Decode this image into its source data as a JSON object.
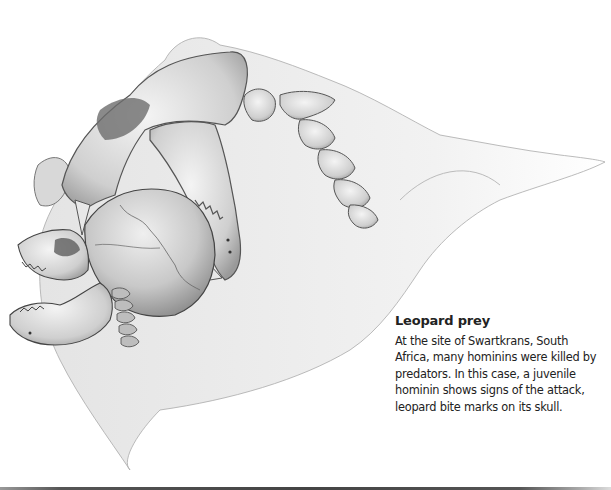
{
  "figure": {
    "illustration_subject": "leopard-skull-biting-hominin-skull",
    "colors": {
      "text": "#222222",
      "background": "#ffffff",
      "rule": "#444444"
    }
  },
  "caption": {
    "title": "Leopard prey",
    "body": "At the site of Swartkrans, South Africa, many hominins were killed by predators. In this case, a juvenile hominin shows signs of the attack, leopard bite marks on its skull."
  }
}
